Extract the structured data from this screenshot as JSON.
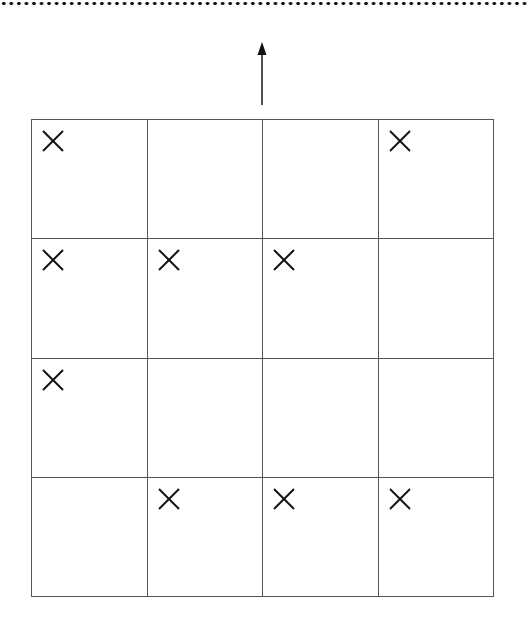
{
  "diagram": {
    "top_border": "dotted-line",
    "direction_indicator": {
      "icon": "arrow-up-icon",
      "direction": "up"
    },
    "grid": {
      "rows": 4,
      "cols": 4,
      "mark_symbol": "×",
      "cells": [
        [
          true,
          false,
          false,
          true
        ],
        [
          true,
          true,
          true,
          false
        ],
        [
          true,
          false,
          false,
          false
        ],
        [
          false,
          true,
          true,
          true
        ]
      ]
    }
  }
}
